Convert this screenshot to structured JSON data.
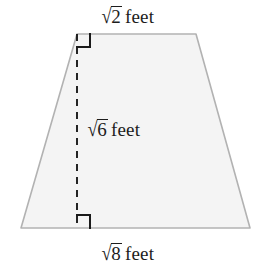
{
  "figure": {
    "shape_name": "trapezoid",
    "fill_color": "#f4f4f4",
    "outline_color": "#b2b2b2",
    "dashed_line_color": "#1a1a1a",
    "right_angle_color": "#1a1a1a",
    "text_color": "#1c1c1c",
    "background_color": "#ffffff",
    "geometry": {
      "top_left": [
        77,
        34
      ],
      "top_right": [
        196,
        34
      ],
      "bottom_right": [
        250,
        228
      ],
      "bottom_left": [
        21,
        228
      ],
      "altitude_x": 77,
      "altitude_top_y": 34,
      "altitude_bottom_y": 228,
      "right_angle_size": 13
    }
  },
  "labels": {
    "top_base": {
      "radical_sign": "√",
      "radicand": "2",
      "unit": "feet",
      "full_text": "√2 feet",
      "role": "top-base-length"
    },
    "height": {
      "radical_sign": "√",
      "radicand": "6",
      "unit": "feet",
      "full_text": "√6 feet",
      "role": "height-length"
    },
    "bottom_base": {
      "radical_sign": "√",
      "radicand": "8",
      "unit": "feet",
      "full_text": "√8 feet",
      "role": "bottom-base-length"
    }
  }
}
